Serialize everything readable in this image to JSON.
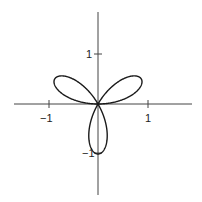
{
  "chart_data": {
    "type": "line",
    "title": "",
    "xlabel": "",
    "ylabel": "",
    "curve": "polar rose r = sin(3θ), θ ∈ [0, π]",
    "series": [
      {
        "name": "r = sin(3θ)",
        "equation": "r = sin(3*theta)",
        "petals": 3,
        "petal_directions_deg": [
          30,
          150,
          270
        ],
        "max_r": 1
      }
    ],
    "xlim": [
      -1.7,
      1.9
    ],
    "ylim": [
      -1.8,
      1.9
    ],
    "x_ticks": [
      -1,
      1
    ],
    "y_ticks": [
      1,
      -1
    ],
    "x_tick_labels": [
      "−1",
      "1"
    ],
    "y_tick_labels": [
      "1",
      "−1"
    ],
    "grid": false,
    "legend": "none",
    "colors": {
      "curve": "#1a1a1a",
      "axis": "#444444"
    }
  },
  "labels": {
    "xneg": "−1",
    "xpos": "1",
    "ypos": "1",
    "yneg": "−1"
  }
}
